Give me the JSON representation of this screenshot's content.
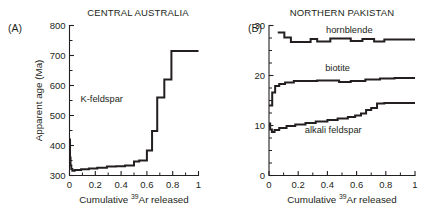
{
  "figure": {
    "background": "#ffffff",
    "ink": "#231f20"
  },
  "panels": [
    {
      "letter": "(A)",
      "title": "CENTRAL AUSTRALIA",
      "xlabel_prefix": "Cumulative ",
      "xlabel_sup": "39",
      "xlabel_suffix": "Ar released",
      "ylabel": "Apparent age (Ma)",
      "curve_labels": [
        {
          "text": "K-feldspar",
          "x": 0.25,
          "y": 545
        }
      ]
    },
    {
      "letter": "(B)",
      "title": "NORTHERN PAKISTAN",
      "xlabel_prefix": "Cumulative ",
      "xlabel_sup": "39",
      "xlabel_suffix": "Ar released",
      "ylabel": "",
      "curve_labels": [
        {
          "text": "hornblende",
          "x": 0.55,
          "y": 28.6
        },
        {
          "text": "biotite",
          "x": 0.47,
          "y": 21.0
        },
        {
          "text": "alkali feldspar",
          "x": 0.44,
          "y": 8.6
        }
      ]
    }
  ],
  "chart_data": [
    {
      "type": "line",
      "subplot": "A",
      "title": "CENTRAL AUSTRALIA",
      "xlabel": "Cumulative 39Ar released",
      "ylabel": "Apparent age (Ma)",
      "xlim": [
        0,
        1
      ],
      "ylim": [
        300,
        800
      ],
      "xticks": [
        0,
        0.2,
        0.4,
        0.6,
        0.8,
        1
      ],
      "xticklabels": [
        "0",
        "0.2",
        "0.4",
        "0.6",
        "0.8",
        "1"
      ],
      "yticks": [
        300,
        400,
        500,
        600,
        700,
        800
      ],
      "yticklabels": [
        "300",
        "400",
        "500",
        "600",
        "700",
        "800"
      ],
      "yminor_step": 50,
      "grid": false,
      "legend": "none",
      "series": [
        {
          "name": "K-feldspar",
          "style": "step-post",
          "steps": [
            {
              "x0": 0.0,
              "x1": 0.004,
              "y": 420
            },
            {
              "x0": 0.004,
              "x1": 0.008,
              "y": 360
            },
            {
              "x0": 0.008,
              "x1": 0.014,
              "y": 333
            },
            {
              "x0": 0.014,
              "x1": 0.022,
              "y": 322
            },
            {
              "x0": 0.022,
              "x1": 0.04,
              "y": 316
            },
            {
              "x0": 0.04,
              "x1": 0.09,
              "y": 318
            },
            {
              "x0": 0.09,
              "x1": 0.15,
              "y": 321
            },
            {
              "x0": 0.15,
              "x1": 0.215,
              "y": 323
            },
            {
              "x0": 0.215,
              "x1": 0.29,
              "y": 326
            },
            {
              "x0": 0.29,
              "x1": 0.36,
              "y": 330
            },
            {
              "x0": 0.36,
              "x1": 0.43,
              "y": 331
            },
            {
              "x0": 0.43,
              "x1": 0.5,
              "y": 333
            },
            {
              "x0": 0.5,
              "x1": 0.54,
              "y": 347
            },
            {
              "x0": 0.54,
              "x1": 0.6,
              "y": 350
            },
            {
              "x0": 0.6,
              "x1": 0.64,
              "y": 383
            },
            {
              "x0": 0.64,
              "x1": 0.68,
              "y": 448
            },
            {
              "x0": 0.68,
              "x1": 0.735,
              "y": 560
            },
            {
              "x0": 0.735,
              "x1": 0.79,
              "y": 620
            },
            {
              "x0": 0.79,
              "x1": 1.0,
              "y": 715
            }
          ]
        }
      ]
    },
    {
      "type": "line",
      "subplot": "B",
      "title": "NORTHERN PAKISTAN",
      "xlabel": "Cumulative 39Ar released",
      "ylabel": "",
      "xlim": [
        0,
        1
      ],
      "ylim": [
        0,
        30
      ],
      "xticks": [
        0,
        0.2,
        0.4,
        0.6,
        0.8,
        1
      ],
      "xticklabels": [
        "0",
        "0.2",
        "0.4",
        "0.6",
        "0.8",
        "1"
      ],
      "yticks": [
        0,
        10,
        20,
        30
      ],
      "yticklabels": [
        "0",
        "10",
        "20",
        "30"
      ],
      "yminor_step": 2.5,
      "grid": false,
      "legend": "inline-labels",
      "series": [
        {
          "name": "hornblende",
          "style": "step-post",
          "steps": [
            {
              "x0": 0.06,
              "x1": 0.105,
              "y": 28.6
            },
            {
              "x0": 0.105,
              "x1": 0.15,
              "y": 27.6
            },
            {
              "x0": 0.15,
              "x1": 0.285,
              "y": 26.7
            },
            {
              "x0": 0.285,
              "x1": 0.33,
              "y": 27.3
            },
            {
              "x0": 0.33,
              "x1": 0.42,
              "y": 26.8
            },
            {
              "x0": 0.42,
              "x1": 0.56,
              "y": 27.4
            },
            {
              "x0": 0.56,
              "x1": 0.64,
              "y": 26.9
            },
            {
              "x0": 0.64,
              "x1": 0.72,
              "y": 27.3
            },
            {
              "x0": 0.72,
              "x1": 0.79,
              "y": 26.8
            },
            {
              "x0": 0.79,
              "x1": 1.0,
              "y": 27.2
            }
          ]
        },
        {
          "name": "biotite",
          "style": "step-post",
          "steps": [
            {
              "x0": 0.0,
              "x1": 0.022,
              "y": 14.0
            },
            {
              "x0": 0.022,
              "x1": 0.042,
              "y": 16.6
            },
            {
              "x0": 0.042,
              "x1": 0.07,
              "y": 17.9
            },
            {
              "x0": 0.07,
              "x1": 0.11,
              "y": 18.3
            },
            {
              "x0": 0.11,
              "x1": 0.17,
              "y": 18.6
            },
            {
              "x0": 0.17,
              "x1": 0.33,
              "y": 18.9
            },
            {
              "x0": 0.33,
              "x1": 0.48,
              "y": 19.0
            },
            {
              "x0": 0.48,
              "x1": 0.56,
              "y": 18.7
            },
            {
              "x0": 0.56,
              "x1": 0.66,
              "y": 18.9
            },
            {
              "x0": 0.66,
              "x1": 0.76,
              "y": 19.2
            },
            {
              "x0": 0.76,
              "x1": 0.86,
              "y": 19.4
            },
            {
              "x0": 0.86,
              "x1": 1.0,
              "y": 19.5
            }
          ]
        },
        {
          "name": "alkali feldspar",
          "style": "step-post",
          "steps": [
            {
              "x0": 0.0,
              "x1": 0.008,
              "y": 10.4
            },
            {
              "x0": 0.008,
              "x1": 0.02,
              "y": 9.2
            },
            {
              "x0": 0.02,
              "x1": 0.038,
              "y": 8.7
            },
            {
              "x0": 0.038,
              "x1": 0.07,
              "y": 9.1
            },
            {
              "x0": 0.07,
              "x1": 0.12,
              "y": 9.5
            },
            {
              "x0": 0.12,
              "x1": 0.18,
              "y": 9.9
            },
            {
              "x0": 0.18,
              "x1": 0.25,
              "y": 10.2
            },
            {
              "x0": 0.25,
              "x1": 0.32,
              "y": 10.5
            },
            {
              "x0": 0.32,
              "x1": 0.4,
              "y": 10.8
            },
            {
              "x0": 0.4,
              "x1": 0.47,
              "y": 11.1
            },
            {
              "x0": 0.47,
              "x1": 0.54,
              "y": 11.4
            },
            {
              "x0": 0.54,
              "x1": 0.59,
              "y": 11.7
            },
            {
              "x0": 0.59,
              "x1": 0.63,
              "y": 12.0
            },
            {
              "x0": 0.63,
              "x1": 0.665,
              "y": 12.4
            },
            {
              "x0": 0.665,
              "x1": 0.7,
              "y": 13.1
            },
            {
              "x0": 0.7,
              "x1": 0.74,
              "y": 13.5
            },
            {
              "x0": 0.74,
              "x1": 0.79,
              "y": 14.4
            },
            {
              "x0": 0.79,
              "x1": 1.0,
              "y": 14.5
            }
          ]
        }
      ]
    }
  ]
}
